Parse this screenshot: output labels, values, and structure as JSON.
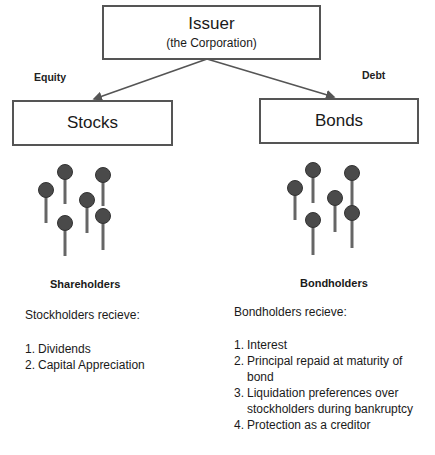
{
  "root": {
    "title": "Issuer",
    "subtitle": "(the Corporation)"
  },
  "edges": {
    "left_label": "Equity",
    "right_label": "Debt"
  },
  "left": {
    "box_label": "Stocks",
    "group_title": "Shareholders",
    "intro": "Stockholders recieve:",
    "items": [
      {
        "num": "1.",
        "text": "Dividends"
      },
      {
        "num": "2.",
        "text": "Capital Appreciation"
      }
    ]
  },
  "right": {
    "box_label": "Bonds",
    "group_title": "Bondholders",
    "intro": "Bondholders recieve:",
    "items": [
      {
        "num": "1.",
        "text": "Interest"
      },
      {
        "num": "2.",
        "text": "Principal repaid at maturity of bond"
      },
      {
        "num": "3.",
        "text": "Liquidation preferences over stockholders during bankruptcy"
      },
      {
        "num": "4.",
        "text": "Protection as a creditor"
      }
    ]
  },
  "colors": {
    "box_border": "#555555",
    "pin_head": "#4a4a4a",
    "pin_stem": "#666666",
    "text": "#1a1a1a"
  }
}
